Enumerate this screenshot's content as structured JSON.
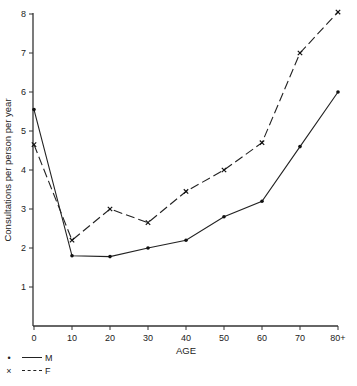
{
  "chart_data": {
    "type": "line",
    "title": "",
    "xlabel": "AGE",
    "ylabel": "Consultations per person per year",
    "categories": [
      "0",
      "10",
      "20",
      "30",
      "40",
      "50",
      "60",
      "70",
      "80+"
    ],
    "x": [
      0,
      10,
      20,
      30,
      40,
      50,
      60,
      70,
      80
    ],
    "ylim": [
      0,
      8
    ],
    "yticks": [
      1,
      2,
      3,
      4,
      5,
      6,
      7,
      8
    ],
    "grid": false,
    "legend_position": "bottom-left",
    "series": [
      {
        "name": "M",
        "marker": "dot",
        "line": "solid",
        "values": [
          5.55,
          1.8,
          1.78,
          2.0,
          2.2,
          2.8,
          3.2,
          4.6,
          6.0
        ]
      },
      {
        "name": "F",
        "marker": "cross",
        "line": "dashed",
        "values": [
          4.65,
          2.2,
          3.0,
          2.65,
          3.45,
          4.0,
          4.7,
          7.0,
          8.05
        ]
      }
    ]
  },
  "legend": {
    "items": [
      {
        "marker": "•",
        "label": "M"
      },
      {
        "marker": "×",
        "label": "F"
      }
    ]
  }
}
